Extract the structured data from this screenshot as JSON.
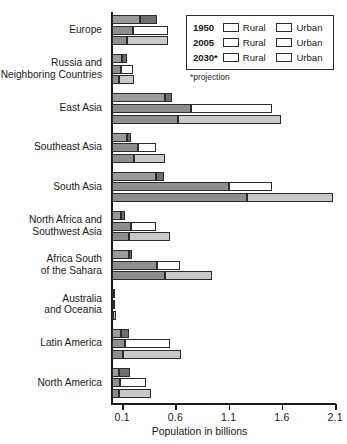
{
  "chart_data": {
    "type": "bar",
    "orientation": "horizontal",
    "title": "",
    "xlabel": "Population in billions",
    "ylabel": "",
    "xlim": [
      0,
      2.18
    ],
    "xticks": [
      0.1,
      0.6,
      1.1,
      1.6,
      2.1
    ],
    "xtick_labels": [
      "0.1",
      "0.6",
      "1.1",
      "1.6",
      "2.1"
    ],
    "grid": false,
    "stacked": true,
    "legend_position": "top-right",
    "categories": [
      "Europe",
      "Russia and\nNeighboring Countries",
      "East Asia",
      "Southeast Asia",
      "South Asia",
      "North Africa and\nSouthwest Asia",
      "Africa South\nof the Sahara",
      "Australia\nand Oceania",
      "Latin America",
      "North America"
    ],
    "series": [
      {
        "name": "1950",
        "segments": [
          "Rural",
          "Urban"
        ],
        "colors": [
          "#9a9a9a",
          "#6e6e6e"
        ],
        "rural": [
          0.27,
          0.1,
          0.5,
          0.15,
          0.42,
          0.09,
          0.16,
          0.01,
          0.09,
          0.07
        ],
        "urban": [
          0.16,
          0.05,
          0.07,
          0.03,
          0.07,
          0.04,
          0.03,
          0.01,
          0.07,
          0.1
        ],
        "totals": [
          0.43,
          0.15,
          0.57,
          0.18,
          0.49,
          0.13,
          0.19,
          0.02,
          0.16,
          0.17
        ]
      },
      {
        "name": "2005",
        "segments": [
          "Rural",
          "Urban"
        ],
        "colors": [
          "#8e8e8e",
          "#ffffff"
        ],
        "rural": [
          0.2,
          0.09,
          0.75,
          0.25,
          1.1,
          0.18,
          0.43,
          0.01,
          0.13,
          0.08
        ],
        "urban": [
          0.33,
          0.11,
          0.76,
          0.17,
          0.41,
          0.24,
          0.21,
          0.02,
          0.42,
          0.24
        ],
        "totals": [
          0.53,
          0.2,
          1.51,
          0.42,
          1.51,
          0.42,
          0.64,
          0.03,
          0.55,
          0.32
        ]
      },
      {
        "name": "2030*",
        "segments": [
          "Rural",
          "Urban"
        ],
        "colors": [
          "#8e8e8e",
          "#c9c9c9"
        ],
        "rural": [
          0.15,
          0.07,
          0.62,
          0.21,
          1.27,
          0.16,
          0.5,
          0.01,
          0.11,
          0.07
        ],
        "urban": [
          0.38,
          0.14,
          0.97,
          0.29,
          0.81,
          0.39,
          0.44,
          0.03,
          0.54,
          0.3
        ],
        "totals": [
          0.53,
          0.21,
          1.59,
          0.5,
          2.08,
          0.55,
          0.94,
          0.04,
          0.65,
          0.37
        ]
      }
    ]
  },
  "legend": {
    "note": "*projection",
    "rows": [
      {
        "year": "1950",
        "rural_label": "Rural",
        "urban_label": "Urban",
        "rural_color": "#9a9a9a",
        "urban_color": "#6e6e6e"
      },
      {
        "year": "2005",
        "rural_label": "Rural",
        "urban_label": "Urban",
        "rural_color": "#8e8e8e",
        "urban_color": "#ffffff"
      },
      {
        "year": "2030*",
        "rural_label": "Rural",
        "urban_label": "Urban",
        "rural_color": "#8e8e8e",
        "urban_color": "#c9c9c9"
      }
    ]
  }
}
